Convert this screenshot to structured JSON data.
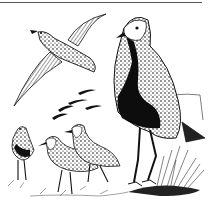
{
  "image": {
    "kind": "pen-and-ink illustration",
    "subject": "plovers",
    "description": "Black-and-white ink drawing of golden plovers: one bird in flight at upper left, a large standing bird with black belly at right, three smaller birds walking in grass at lower left, and a distant flock of flying birds in the background.",
    "palette": {
      "ink": "#111111",
      "paper": "#ffffff",
      "rule": "#555555"
    },
    "elements": [
      {
        "name": "flying-plover",
        "position": "upper-left"
      },
      {
        "name": "standing-plover",
        "position": "right",
        "feature": "black belly, speckled back"
      },
      {
        "name": "walking-plovers",
        "count": 3,
        "position": "lower-left"
      },
      {
        "name": "distant-flock",
        "position": "center background"
      },
      {
        "name": "grass-tuft",
        "position": "lower-right"
      },
      {
        "name": "hill-outline",
        "position": "right background"
      }
    ]
  }
}
